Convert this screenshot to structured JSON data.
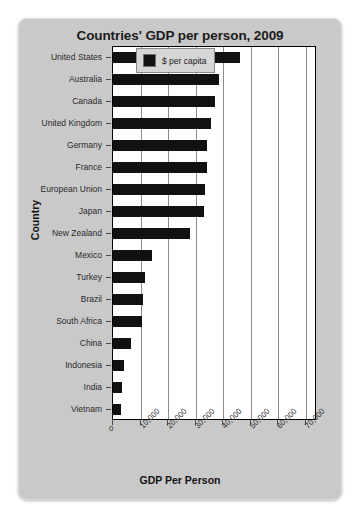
{
  "chart_data": {
    "type": "bar",
    "orientation": "horizontal",
    "title": "Countries' GDP per person, 2009",
    "xlabel": "GDP Per Person",
    "ylabel": "Country",
    "categories": [
      "United States",
      "Australia",
      "Canada",
      "United Kingdom",
      "Germany",
      "France",
      "European Union",
      "Japan",
      "New Zealand",
      "Mexico",
      "Turkey",
      "Brazil",
      "South Africa",
      "China",
      "Indonesia",
      "India",
      "Vietnam"
    ],
    "values": [
      46000,
      38500,
      37000,
      35500,
      34000,
      34000,
      33500,
      33000,
      28000,
      14000,
      11500,
      11000,
      10500,
      6500,
      4000,
      3200,
      2900
    ],
    "series": [
      {
        "name": "$ per capita",
        "values": [
          46000,
          38500,
          37000,
          35500,
          34000,
          34000,
          33500,
          33000,
          28000,
          14000,
          11500,
          11000,
          10500,
          6500,
          4000,
          3200,
          2900
        ]
      }
    ],
    "xlim": [
      0,
      74000
    ],
    "xticks": [
      0,
      10000,
      20000,
      30000,
      40000,
      50000,
      60000,
      70000
    ],
    "xtick_labels": [
      "0",
      "10,000",
      "20,000",
      "30,000",
      "40,000",
      "50,000",
      "60,000",
      "70,000"
    ],
    "grid": "vertical",
    "legend": {
      "position": "top-right",
      "entries": [
        "$ per capita"
      ]
    },
    "bar_color": "#111111",
    "plot_background": "#ffffff",
    "card_background": "#c9c9c9"
  }
}
